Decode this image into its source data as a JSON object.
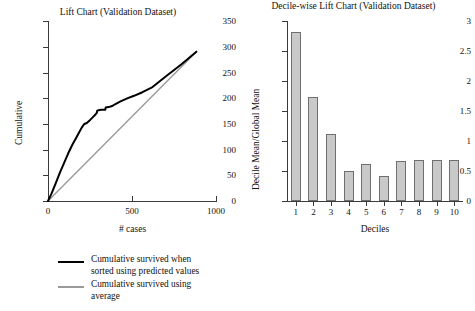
{
  "colors": {
    "predicted_line": "#000000",
    "average_line": "#9a9a9a",
    "bar_fill": "#c9c9c9",
    "bar_border": "#6f6f6f",
    "axis": "#3a3a3a"
  },
  "legend": {
    "items": [
      {
        "swatch": "predicted-line-swatch",
        "color": "#000000",
        "line1": "Cumulative survived when",
        "line2": "sorted using predicted values"
      },
      {
        "swatch": "average-line-swatch",
        "color": "#9a9a9a",
        "line1": "Cumulative survived using",
        "line2": "average"
      }
    ]
  },
  "chart_data": [
    {
      "type": "line",
      "name": "lift-chart",
      "title": "Lift Chart (Validation Dataset)",
      "xlabel": "# cases",
      "ylabel": "Cumulative",
      "xlim": [
        0,
        1000
      ],
      "ylim": [
        0,
        350
      ],
      "xticks": [
        0,
        500,
        1000
      ],
      "yticks": [
        0,
        50,
        100,
        150,
        200,
        250,
        300,
        350
      ],
      "xtick_labels": [
        "0",
        "500",
        "1000"
      ],
      "ytick_labels": [
        "0",
        "50",
        "100",
        "150",
        "200",
        "250",
        "300",
        "350"
      ],
      "grid": false,
      "legend_position": "below",
      "series": [
        {
          "name": "Cumulative survived when sorted using predicted values",
          "color": "#000000",
          "x": [
            0,
            20,
            45,
            70,
            95,
            120,
            145,
            165,
            185,
            200,
            215,
            230,
            250,
            265,
            280,
            290,
            292,
            300,
            315,
            330,
            340,
            342,
            360,
            380,
            400,
            430,
            470,
            510,
            560,
            620,
            700,
            790,
            880
          ],
          "y": [
            0,
            14,
            34,
            55,
            74,
            93,
            110,
            122,
            134,
            143,
            150,
            152,
            158,
            163,
            168,
            172,
            176,
            177,
            178,
            178,
            178,
            182,
            183,
            185,
            189,
            194,
            200,
            205,
            212,
            222,
            243,
            266,
            291
          ]
        },
        {
          "name": "Cumulative survived using average",
          "color": "#9a9a9a",
          "x": [
            0,
            880
          ],
          "y": [
            0,
            291
          ]
        }
      ]
    },
    {
      "type": "bar",
      "name": "decile-lift-chart",
      "title": "Decile-wise Lift Chart (Validation Dataset)",
      "xlabel": "Deciles",
      "ylabel": "Decile Mean/Global Mean",
      "categories": [
        "1",
        "2",
        "3",
        "4",
        "5",
        "6",
        "7",
        "8",
        "9",
        "10"
      ],
      "values": [
        2.82,
        1.73,
        1.12,
        0.5,
        0.61,
        0.41,
        0.67,
        0.69,
        0.69,
        0.69
      ],
      "ylim": [
        0,
        3
      ],
      "yticks": [
        0,
        0.5,
        1,
        1.5,
        2,
        2.5,
        3
      ],
      "ytick_labels": [
        "0",
        "0.5",
        "1",
        "1.5",
        "2",
        "2.5",
        "3"
      ],
      "grid": false,
      "bar_fill": "#c9c9c9",
      "bar_border": "#6f6f6f"
    }
  ]
}
